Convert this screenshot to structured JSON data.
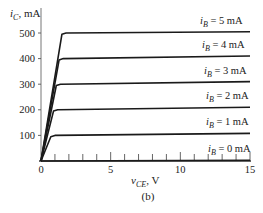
{
  "chart_data": {
    "type": "line",
    "title": "",
    "caption": "(b)",
    "xlabel": "v_CE, V",
    "ylabel": "i_C, mA",
    "xlim": [
      0,
      15
    ],
    "ylim": [
      0,
      550
    ],
    "x_ticks": [
      0,
      5,
      10,
      15
    ],
    "x_minor_ticks_step": 1,
    "y_ticks": [
      100,
      200,
      300,
      400,
      500
    ],
    "grid": false,
    "legend": "inline labels above each curve",
    "series": [
      {
        "name": "i_B = 0 mA",
        "label": "iB = 0 mA",
        "x": [
          0,
          15
        ],
        "values": [
          0,
          3
        ]
      },
      {
        "name": "i_B = 1 mA",
        "label": "iB = 1 mA",
        "x": [
          0,
          0.7,
          1.0,
          15
        ],
        "values": [
          0,
          95,
          100,
          108
        ]
      },
      {
        "name": "i_B = 2 mA",
        "label": "iB = 2 mA",
        "x": [
          0,
          0.9,
          1.2,
          15
        ],
        "values": [
          0,
          195,
          200,
          210
        ]
      },
      {
        "name": "i_B = 3 mA",
        "label": "iB = 3 mA",
        "x": [
          0,
          1.1,
          1.4,
          15
        ],
        "values": [
          0,
          295,
          300,
          310
        ]
      },
      {
        "name": "i_B = 4 mA",
        "label": "iB = 4 mA",
        "x": [
          0,
          1.3,
          1.6,
          15
        ],
        "values": [
          0,
          395,
          400,
          410
        ]
      },
      {
        "name": "i_B = 5 mA",
        "label": "iB = 5 mA",
        "x": [
          0,
          1.5,
          1.8,
          15
        ],
        "values": [
          0,
          495,
          500,
          505
        ]
      }
    ]
  },
  "labels": {
    "y_axis_var": "i",
    "y_axis_sub": "C",
    "y_axis_unit": ", mA",
    "x_axis_var": "v",
    "x_axis_sub": "CE",
    "x_axis_unit": ", V",
    "caption": "(b)",
    "curve_var": "i",
    "curve_sub": "B"
  }
}
